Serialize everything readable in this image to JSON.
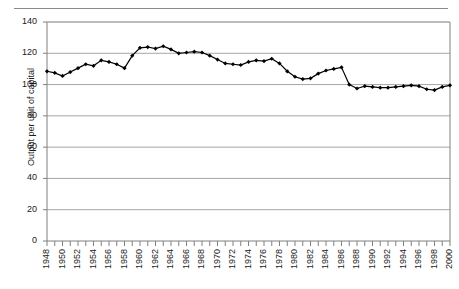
{
  "chart_data": {
    "type": "line",
    "title": "",
    "xlabel": "",
    "ylabel": "Output per unit of capital",
    "ylim": [
      0,
      140
    ],
    "ytick_labels": [
      "0",
      "20",
      "40",
      "60",
      "80",
      "100",
      "120",
      "140"
    ],
    "ytick_values": [
      0,
      20,
      40,
      60,
      80,
      100,
      120,
      140
    ],
    "grid": "horizontal",
    "legend": "none",
    "marker": "diamond",
    "line_color": "#000000",
    "grid_color": "#a6a6a6",
    "axis_color": "#808080",
    "xtick_labels": [
      "1948",
      "1950",
      "1952",
      "1954",
      "1956",
      "1958",
      "1960",
      "1962",
      "1964",
      "1966",
      "1968",
      "1970",
      "1972",
      "1974",
      "1976",
      "1978",
      "1980",
      "1982",
      "1984",
      "1986",
      "1988",
      "1990",
      "1992",
      "1994",
      "1996",
      "1998",
      "2000"
    ],
    "xtick_step": 2,
    "x": [
      1948,
      1949,
      1950,
      1951,
      1952,
      1953,
      1954,
      1955,
      1956,
      1957,
      1958,
      1959,
      1960,
      1961,
      1962,
      1963,
      1964,
      1965,
      1966,
      1967,
      1968,
      1969,
      1970,
      1971,
      1972,
      1973,
      1974,
      1975,
      1976,
      1977,
      1978,
      1979,
      1980,
      1981,
      1982,
      1983,
      1984,
      1985,
      1986,
      1987,
      1988,
      1989,
      1990,
      1991,
      1992,
      1993,
      1994,
      1995,
      1996,
      1997,
      1998,
      1999,
      2000
    ],
    "values": [
      108.5,
      107.5,
      105.5,
      108.0,
      110.5,
      113.0,
      112.0,
      115.5,
      114.5,
      113.0,
      110.5,
      118.5,
      123.5,
      124.0,
      123.0,
      124.5,
      122.5,
      120.0,
      120.5,
      121.0,
      120.5,
      118.5,
      116.0,
      113.5,
      113.0,
      112.5,
      114.5,
      115.5,
      115.0,
      116.5,
      113.5,
      108.5,
      105.0,
      103.5,
      104.0,
      107.0,
      109.0,
      110.0,
      111.0,
      100.0,
      97.5,
      99.0,
      98.5,
      98.0,
      98.0,
      98.5,
      99.0,
      99.5,
      99.0,
      97.0,
      96.5,
      98.5,
      99.5
    ],
    "series_name": "Output per unit of capital"
  },
  "plot": {
    "x_start_year": 1948,
    "x_end_year": 2000
  }
}
